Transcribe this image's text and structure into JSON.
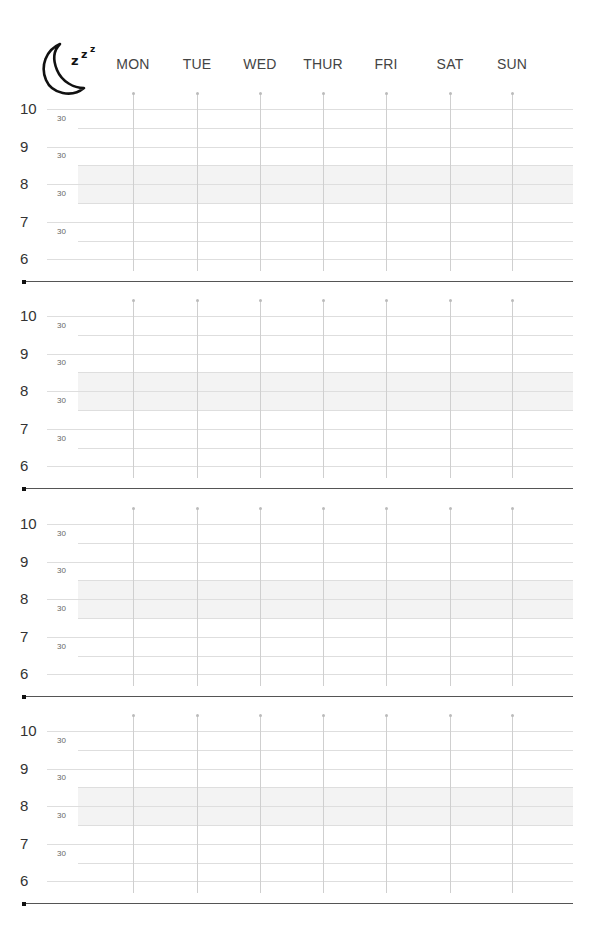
{
  "header": {
    "icon": "sleep-moon-zzz-icon",
    "days": [
      "MON",
      "TUE",
      "WED",
      "THUR",
      "FRI",
      "SAT",
      "SUN"
    ]
  },
  "hour_labels": [
    "10",
    "9",
    "8",
    "7",
    "6"
  ],
  "half_label": "30",
  "weeks": [
    {
      "index": 1
    },
    {
      "index": 2
    },
    {
      "index": 3
    },
    {
      "index": 4
    }
  ],
  "colors": {
    "grid": "#dedede",
    "shade": "#f3f3f3",
    "vertical": "#cfcfcf",
    "rule": "#555555"
  }
}
